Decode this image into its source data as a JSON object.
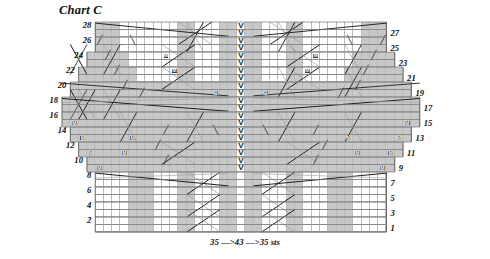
{
  "title": "Chart C",
  "footnote": "35 —>43 —>35 sts",
  "grid": {
    "cell_w": 8.32,
    "cell_h": 7.5,
    "cols": 43,
    "rows": 28,
    "center_col": 21,
    "colors": {
      "shaded": "#c8c8c8",
      "plain": "#ffffff",
      "gridline": "#b9b9b9",
      "rowline": "#6d6d6d",
      "symbol": "#1a1a1a",
      "marker_fill": "#3b3b3b"
    }
  },
  "row_numbers_left": [
    28,
    26,
    24,
    22,
    20,
    18,
    16,
    14,
    12,
    10,
    8,
    6,
    4,
    2
  ],
  "row_numbers_right": [
    27,
    25,
    23,
    21,
    19,
    17,
    15,
    13,
    11,
    9,
    7,
    5,
    3,
    1
  ],
  "row_widths": [
    {
      "row": 1,
      "left": 4,
      "right": 38
    },
    {
      "row": 2,
      "left": 4,
      "right": 38
    },
    {
      "row": 3,
      "left": 4,
      "right": 38
    },
    {
      "row": 4,
      "left": 4,
      "right": 38
    },
    {
      "row": 5,
      "left": 4,
      "right": 38
    },
    {
      "row": 6,
      "left": 4,
      "right": 38
    },
    {
      "row": 7,
      "left": 4,
      "right": 38
    },
    {
      "row": 8,
      "left": 4,
      "right": 38
    },
    {
      "row": 9,
      "left": 3,
      "right": 39
    },
    {
      "row": 10,
      "left": 3,
      "right": 39
    },
    {
      "row": 11,
      "left": 2,
      "right": 40
    },
    {
      "row": 12,
      "left": 2,
      "right": 40
    },
    {
      "row": 13,
      "left": 1,
      "right": 41
    },
    {
      "row": 14,
      "left": 1,
      "right": 41
    },
    {
      "row": 15,
      "left": 0,
      "right": 42
    },
    {
      "row": 16,
      "left": 0,
      "right": 42
    },
    {
      "row": 17,
      "left": 0,
      "right": 42
    },
    {
      "row": 18,
      "left": 0,
      "right": 42
    },
    {
      "row": 19,
      "left": 1,
      "right": 41
    },
    {
      "row": 20,
      "left": 1,
      "right": 41
    },
    {
      "row": 21,
      "left": 2,
      "right": 40
    },
    {
      "row": 22,
      "left": 2,
      "right": 40
    },
    {
      "row": 23,
      "left": 3,
      "right": 39
    },
    {
      "row": 24,
      "left": 3,
      "right": 39
    },
    {
      "row": 25,
      "left": 4,
      "right": 38
    },
    {
      "row": 26,
      "left": 4,
      "right": 38
    },
    {
      "row": 27,
      "left": 4,
      "right": 38
    },
    {
      "row": 28,
      "left": 4,
      "right": 38
    }
  ],
  "shaded_cells": [
    {
      "row": 1,
      "cols": [
        8,
        9,
        10,
        14,
        15,
        19,
        20,
        22,
        23,
        27,
        28,
        32,
        33,
        34
      ]
    },
    {
      "row": 2,
      "cols": [
        8,
        9,
        10,
        14,
        15,
        19,
        20,
        22,
        23,
        27,
        28,
        32,
        33,
        34
      ]
    },
    {
      "row": 3,
      "cols": [
        8,
        9,
        10,
        14,
        15,
        19,
        20,
        22,
        23,
        27,
        28,
        32,
        33,
        34
      ]
    },
    {
      "row": 4,
      "cols": [
        8,
        9,
        10,
        14,
        15,
        19,
        20,
        22,
        23,
        27,
        28,
        32,
        33,
        34
      ]
    },
    {
      "row": 5,
      "cols": [
        8,
        9,
        10,
        14,
        15,
        19,
        20,
        22,
        23,
        27,
        28,
        32,
        33,
        34
      ]
    },
    {
      "row": 6,
      "cols": [
        8,
        9,
        10,
        14,
        15,
        19,
        20,
        22,
        23,
        27,
        28,
        32,
        33,
        34
      ]
    },
    {
      "row": 7,
      "cols": [
        8,
        9,
        10,
        14,
        15,
        19,
        20,
        22,
        23,
        27,
        28,
        32,
        33,
        34
      ]
    },
    {
      "row": 8,
      "cols": [
        8,
        9,
        10,
        14,
        15,
        19,
        20,
        22,
        23,
        27,
        28,
        32,
        33,
        34
      ]
    },
    {
      "row": 9,
      "cols": [
        3,
        4,
        5,
        6,
        7,
        8,
        9,
        10,
        11,
        12,
        13,
        14,
        15,
        16,
        17,
        18,
        19,
        20,
        22,
        23,
        24,
        25,
        26,
        27,
        28,
        29,
        30,
        31,
        32,
        33,
        34,
        35,
        36,
        37,
        38,
        39
      ]
    },
    {
      "row": 10,
      "cols": [
        3,
        4,
        5,
        6,
        7,
        8,
        9,
        10,
        11,
        12,
        13,
        14,
        15,
        16,
        17,
        18,
        19,
        20,
        22,
        23,
        24,
        25,
        26,
        27,
        28,
        29,
        30,
        31,
        32,
        33,
        34,
        35,
        36,
        37,
        38,
        39
      ]
    },
    {
      "row": 11,
      "cols": [
        2,
        3,
        4,
        5,
        6,
        7,
        8,
        9,
        10,
        11,
        12,
        13,
        14,
        15,
        16,
        17,
        18,
        19,
        20,
        22,
        23,
        24,
        25,
        26,
        27,
        28,
        29,
        30,
        31,
        32,
        33,
        34,
        35,
        36,
        37,
        38,
        39,
        40
      ]
    },
    {
      "row": 12,
      "cols": [
        2,
        3,
        4,
        5,
        6,
        7,
        8,
        9,
        10,
        11,
        12,
        13,
        14,
        15,
        16,
        17,
        18,
        19,
        20,
        22,
        23,
        24,
        25,
        26,
        27,
        28,
        29,
        30,
        31,
        32,
        33,
        34,
        35,
        36,
        37,
        38,
        39,
        40
      ]
    },
    {
      "row": 13,
      "cols": [
        1,
        2,
        3,
        4,
        5,
        6,
        7,
        8,
        9,
        10,
        11,
        12,
        13,
        14,
        15,
        16,
        17,
        18,
        19,
        20,
        22,
        23,
        24,
        25,
        26,
        27,
        28,
        29,
        30,
        31,
        32,
        33,
        34,
        35,
        36,
        37,
        38,
        39,
        40,
        41
      ]
    },
    {
      "row": 14,
      "cols": [
        1,
        2,
        3,
        4,
        5,
        6,
        7,
        8,
        9,
        10,
        11,
        12,
        13,
        14,
        15,
        16,
        17,
        18,
        19,
        20,
        22,
        23,
        24,
        25,
        26,
        27,
        28,
        29,
        30,
        31,
        32,
        33,
        34,
        35,
        36,
        37,
        38,
        39,
        40,
        41
      ]
    },
    {
      "row": 15,
      "cols": [
        0,
        1,
        2,
        3,
        4,
        5,
        6,
        7,
        8,
        9,
        10,
        11,
        12,
        13,
        14,
        15,
        16,
        17,
        18,
        19,
        20,
        22,
        23,
        24,
        25,
        26,
        27,
        28,
        29,
        30,
        31,
        32,
        33,
        34,
        35,
        36,
        37,
        38,
        39,
        40,
        41,
        42
      ]
    },
    {
      "row": 16,
      "cols": [
        0,
        1,
        2,
        3,
        4,
        5,
        6,
        7,
        8,
        9,
        10,
        11,
        12,
        13,
        14,
        15,
        16,
        17,
        18,
        19,
        20,
        22,
        23,
        24,
        25,
        26,
        27,
        28,
        29,
        30,
        31,
        32,
        33,
        34,
        35,
        36,
        37,
        38,
        39,
        40,
        41,
        42
      ]
    },
    {
      "row": 17,
      "cols": [
        0,
        1,
        2,
        3,
        4,
        5,
        6,
        7,
        8,
        9,
        10,
        11,
        12,
        13,
        14,
        15,
        16,
        17,
        18,
        19,
        20,
        22,
        23,
        24,
        25,
        26,
        27,
        28,
        29,
        30,
        31,
        32,
        33,
        34,
        35,
        36,
        37,
        38,
        39,
        40,
        41,
        42
      ]
    },
    {
      "row": 18,
      "cols": [
        0,
        1,
        2,
        3,
        4,
        5,
        6,
        7,
        8,
        9,
        10,
        11,
        12,
        13,
        14,
        15,
        16,
        17,
        18,
        19,
        20,
        22,
        23,
        24,
        25,
        26,
        27,
        28,
        29,
        30,
        31,
        32,
        33,
        34,
        35,
        36,
        37,
        38,
        39,
        40,
        41,
        42
      ]
    },
    {
      "row": 19,
      "cols": [
        1,
        2,
        3,
        4,
        5,
        6,
        7,
        8,
        9,
        10,
        11,
        12,
        13,
        14,
        15,
        16,
        17,
        18,
        19,
        20,
        22,
        23,
        24,
        25,
        26,
        27,
        28,
        29,
        30,
        31,
        32,
        33,
        34,
        35,
        36,
        37,
        38,
        39,
        40,
        41
      ]
    },
    {
      "row": 20,
      "cols": [
        1,
        2,
        3,
        4,
        5,
        6,
        7,
        8,
        9,
        10,
        11,
        12,
        13,
        14,
        15,
        16,
        17,
        18,
        19,
        20,
        22,
        23,
        24,
        25,
        26,
        27,
        28,
        29,
        30,
        31,
        32,
        33,
        34,
        35,
        36,
        37,
        38,
        39,
        40,
        41
      ]
    },
    {
      "row": 21,
      "cols": [
        2,
        3,
        4,
        5,
        6,
        7,
        8,
        14,
        15,
        19,
        20,
        22,
        23,
        27,
        28,
        34,
        35,
        36,
        37,
        38,
        39,
        40
      ]
    },
    {
      "row": 22,
      "cols": [
        2,
        3,
        4,
        5,
        6,
        7,
        8,
        14,
        15,
        19,
        20,
        22,
        23,
        27,
        28,
        34,
        35,
        36,
        37,
        38,
        39,
        40
      ]
    },
    {
      "row": 23,
      "cols": [
        3,
        4,
        5,
        6,
        7,
        14,
        15,
        19,
        20,
        22,
        23,
        27,
        28,
        35,
        36,
        37,
        38,
        39
      ]
    },
    {
      "row": 24,
      "cols": [
        3,
        4,
        5,
        6,
        7,
        14,
        15,
        19,
        20,
        22,
        23,
        27,
        28,
        35,
        36,
        37,
        38,
        39
      ]
    },
    {
      "row": 25,
      "cols": [
        4,
        5,
        6,
        14,
        15,
        19,
        20,
        22,
        23,
        27,
        28,
        36,
        37,
        38
      ]
    },
    {
      "row": 26,
      "cols": [
        4,
        5,
        6,
        14,
        15,
        19,
        20,
        22,
        23,
        27,
        28,
        36,
        37,
        38
      ]
    },
    {
      "row": 27,
      "cols": [
        4,
        5,
        6,
        14,
        15,
        19,
        20,
        22,
        23,
        27,
        28,
        36,
        37,
        38
      ]
    },
    {
      "row": 28,
      "cols": [
        4,
        5,
        6,
        14,
        15,
        19,
        20,
        22,
        23,
        27,
        28,
        36,
        37,
        38
      ]
    }
  ],
  "symbols": {
    "v_column_col": 21,
    "v_rows": [
      9,
      10,
      11,
      12,
      13,
      14,
      15,
      16,
      17,
      18,
      19,
      20,
      21,
      22,
      23,
      24,
      25,
      26,
      27,
      28
    ],
    "m_cells": [
      {
        "row": 9,
        "col": 4
      },
      {
        "row": 9,
        "col": 38
      },
      {
        "row": 11,
        "col": 3
      },
      {
        "row": 11,
        "col": 39
      },
      {
        "row": 13,
        "col": 2
      },
      {
        "row": 13,
        "col": 40
      },
      {
        "row": 15,
        "col": 1
      },
      {
        "row": 15,
        "col": 41
      },
      {
        "row": 11,
        "col": 35
      },
      {
        "row": 11,
        "col": 7
      },
      {
        "row": 13,
        "col": 8
      },
      {
        "row": 13,
        "col": 34
      },
      {
        "row": 22,
        "col": 13
      },
      {
        "row": 22,
        "col": 29
      },
      {
        "row": 24,
        "col": 12
      },
      {
        "row": 24,
        "col": 30
      }
    ],
    "b_cells": [
      {
        "row": 19,
        "col": 18
      },
      {
        "row": 19,
        "col": 24
      }
    ],
    "slash_cells": [
      {
        "row": 10,
        "col": 12
      },
      {
        "row": 10,
        "col": 30
      },
      {
        "row": 12,
        "col": 11
      },
      {
        "row": 12,
        "col": 31
      },
      {
        "row": 20,
        "col": 7
      },
      {
        "row": 20,
        "col": 35
      },
      {
        "row": 22,
        "col": 6
      },
      {
        "row": 22,
        "col": 36
      },
      {
        "row": 24,
        "col": 5
      },
      {
        "row": 24,
        "col": 37
      },
      {
        "row": 26,
        "col": 4
      },
      {
        "row": 26,
        "col": 38
      },
      {
        "row": 14,
        "col": 12
      },
      {
        "row": 14,
        "col": 30
      },
      {
        "row": 19,
        "col": 9
      },
      {
        "row": 19,
        "col": 33
      }
    ],
    "bslash_cells": [
      {
        "row": 14,
        "col": 18
      },
      {
        "row": 14,
        "col": 24
      },
      {
        "row": 26,
        "col": 8
      },
      {
        "row": 26,
        "col": 34
      }
    ]
  },
  "glyph_labels": {
    "v": "V",
    "m": "M",
    "b": "B",
    "slash": "╱",
    "bslash": "╲"
  }
}
